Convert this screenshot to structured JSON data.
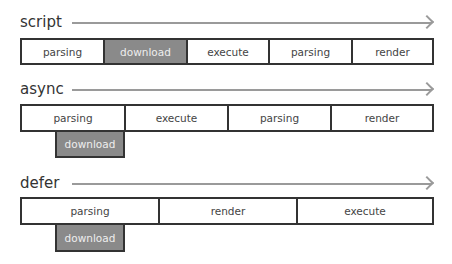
{
  "rows": [
    {
      "label": "script",
      "segments": [
        "parsing",
        "download",
        "execute",
        "parsing",
        "render"
      ],
      "highlighted": "download"
    },
    {
      "label": "async",
      "segments": [
        "parsing",
        "execute",
        "parsing",
        "render"
      ],
      "below": "download"
    },
    {
      "label": "defer",
      "segments": [
        "parsing",
        "render",
        "execute"
      ],
      "below": "download"
    }
  ],
  "colors": {
    "border": "#333333",
    "download_fill": "#8a8a8a",
    "arrow": "#9a9a9a"
  }
}
